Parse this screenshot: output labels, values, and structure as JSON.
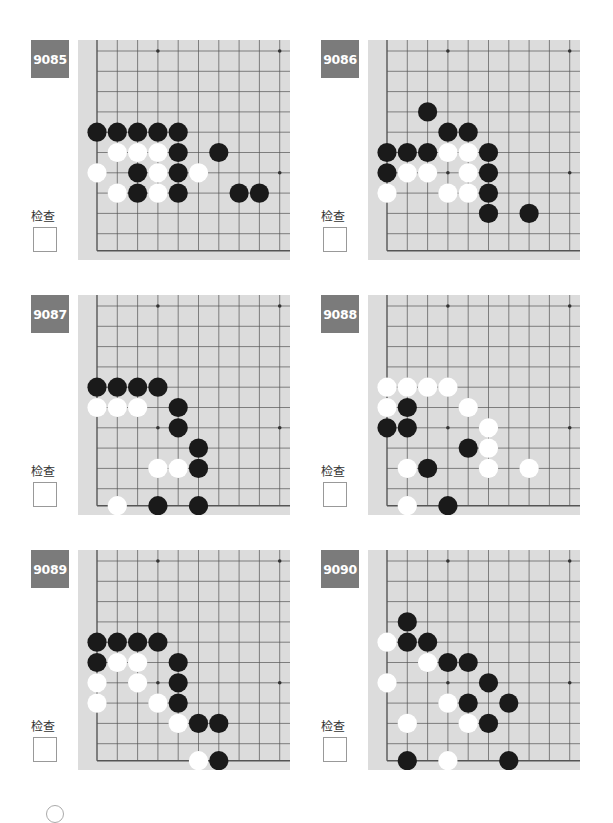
{
  "page": {
    "check_label": "检查"
  },
  "board_style": {
    "background": "#dcdcdc",
    "line_color": "#555555",
    "black_stone": "#1a1a1a",
    "white_stone": "#ffffff",
    "badge_color": "#7b7b7b"
  },
  "problems": [
    {
      "number": "9085",
      "black": [
        [
          0,
          4
        ],
        [
          1,
          4
        ],
        [
          2,
          4
        ],
        [
          3,
          4
        ],
        [
          4,
          4
        ],
        [
          4,
          5
        ],
        [
          6,
          5
        ],
        [
          2,
          6
        ],
        [
          4,
          6
        ],
        [
          2,
          7
        ],
        [
          4,
          7
        ],
        [
          7,
          7
        ],
        [
          8,
          7
        ]
      ],
      "white": [
        [
          1,
          5
        ],
        [
          2,
          5
        ],
        [
          3,
          5
        ],
        [
          0,
          6
        ],
        [
          3,
          6
        ],
        [
          5,
          6
        ],
        [
          1,
          7
        ],
        [
          3,
          7
        ]
      ]
    },
    {
      "number": "9086",
      "black": [
        [
          2,
          3
        ],
        [
          3,
          4
        ],
        [
          4,
          4
        ],
        [
          0,
          5
        ],
        [
          1,
          5
        ],
        [
          2,
          5
        ],
        [
          5,
          5
        ],
        [
          0,
          6
        ],
        [
          5,
          6
        ],
        [
          5,
          7
        ],
        [
          5,
          8
        ],
        [
          7,
          8
        ]
      ],
      "white": [
        [
          3,
          5
        ],
        [
          4,
          5
        ],
        [
          1,
          6
        ],
        [
          2,
          6
        ],
        [
          4,
          6
        ],
        [
          0,
          7
        ],
        [
          3,
          7
        ],
        [
          4,
          7
        ]
      ]
    },
    {
      "number": "9087",
      "black": [
        [
          0,
          4
        ],
        [
          1,
          4
        ],
        [
          2,
          4
        ],
        [
          3,
          4
        ],
        [
          4,
          5
        ],
        [
          4,
          6
        ],
        [
          5,
          7
        ],
        [
          5,
          8
        ],
        [
          3,
          9
        ],
        [
          5,
          9
        ]
      ],
      "white": [
        [
          0,
          5
        ],
        [
          1,
          5
        ],
        [
          2,
          5
        ],
        [
          3,
          8
        ],
        [
          4,
          8
        ],
        [
          1,
          9
        ]
      ]
    },
    {
      "number": "9088",
      "black": [
        [
          1,
          5
        ],
        [
          0,
          6
        ],
        [
          1,
          6
        ],
        [
          4,
          7
        ],
        [
          2,
          8
        ],
        [
          3,
          9
        ]
      ],
      "white": [
        [
          0,
          4
        ],
        [
          1,
          4
        ],
        [
          2,
          4
        ],
        [
          3,
          4
        ],
        [
          0,
          5
        ],
        [
          4,
          5
        ],
        [
          5,
          6
        ],
        [
          5,
          7
        ],
        [
          1,
          8
        ],
        [
          5,
          8
        ],
        [
          7,
          8
        ],
        [
          1,
          9
        ]
      ]
    },
    {
      "number": "9089",
      "black": [
        [
          0,
          4
        ],
        [
          1,
          4
        ],
        [
          2,
          4
        ],
        [
          3,
          4
        ],
        [
          0,
          5
        ],
        [
          4,
          5
        ],
        [
          4,
          6
        ],
        [
          4,
          7
        ],
        [
          5,
          8
        ],
        [
          6,
          8
        ],
        [
          6,
          9
        ]
      ],
      "white": [
        [
          1,
          5
        ],
        [
          2,
          5
        ],
        [
          0,
          6
        ],
        [
          2,
          6
        ],
        [
          0,
          7
        ],
        [
          3,
          7
        ],
        [
          4,
          8
        ],
        [
          5,
          9
        ]
      ]
    },
    {
      "number": "9090",
      "black": [
        [
          1,
          3
        ],
        [
          1,
          4
        ],
        [
          2,
          4
        ],
        [
          3,
          5
        ],
        [
          4,
          5
        ],
        [
          5,
          6
        ],
        [
          4,
          7
        ],
        [
          6,
          7
        ],
        [
          5,
          8
        ],
        [
          1,
          9
        ],
        [
          6,
          9
        ]
      ],
      "white": [
        [
          0,
          4
        ],
        [
          2,
          5
        ],
        [
          0,
          6
        ],
        [
          3,
          7
        ],
        [
          1,
          8
        ],
        [
          4,
          8
        ],
        [
          3,
          9
        ]
      ]
    }
  ]
}
